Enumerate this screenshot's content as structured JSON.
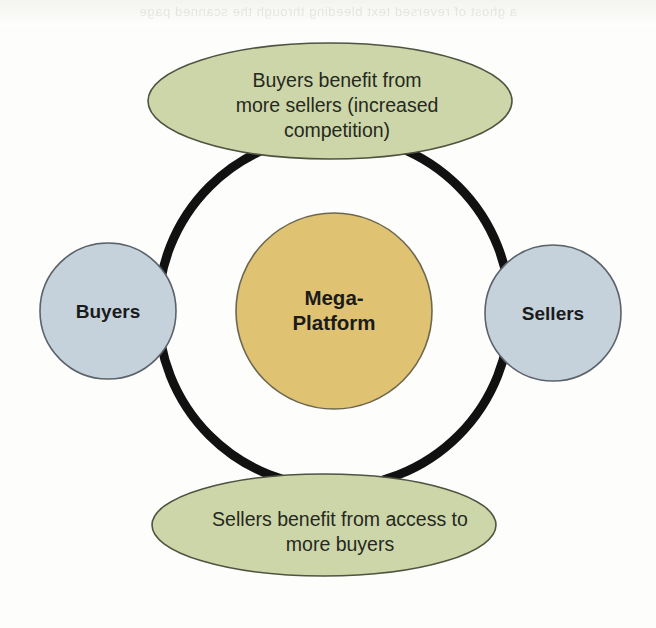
{
  "diagram": {
    "type": "network-effects-flywheel",
    "title_visible": false,
    "background_color": "#fdfdfc",
    "ring": {
      "label": "feedback-loop-ring",
      "color": "#111111",
      "stroke_width": 9,
      "center_x": 334,
      "center_y": 311,
      "radius": 176
    },
    "center_node": {
      "label": "Mega-Platform",
      "line1": "Mega-",
      "line2": "Platform",
      "fill": "#dfc372",
      "stroke": "#6e6750",
      "shape": "circle",
      "cx": 334,
      "cy": 311,
      "r": 98
    },
    "side_nodes": [
      {
        "id": "buyers",
        "label": "Buyers",
        "fill": "#c5d2dc",
        "stroke": "#5b626a",
        "shape": "circle",
        "cx": 108,
        "cy": 311,
        "r": 68
      },
      {
        "id": "sellers",
        "label": "Sellers",
        "fill": "#c5d2dc",
        "stroke": "#5b626a",
        "shape": "circle",
        "cx": 553,
        "cy": 313,
        "r": 68
      }
    ],
    "benefit_nodes": [
      {
        "id": "buyers-benefit",
        "position": "top",
        "lines": [
          "Buyers benefit from",
          "more sellers (increased",
          "competition)"
        ],
        "fill": "#cdd6a8",
        "stroke": "#4f5340",
        "shape": "ellipse",
        "cx": 330,
        "cy": 101,
        "rx": 182,
        "ry": 58
      },
      {
        "id": "sellers-benefit",
        "position": "bottom",
        "lines": [
          "Sellers benefit from access to",
          "more buyers"
        ],
        "fill": "#cdd6a8",
        "stroke": "#4f5340",
        "shape": "ellipse",
        "cx": 324,
        "cy": 525,
        "rx": 172,
        "ry": 51
      }
    ],
    "bleed_through_text": "a ghost of reversed text bleeding through the scanned page"
  }
}
